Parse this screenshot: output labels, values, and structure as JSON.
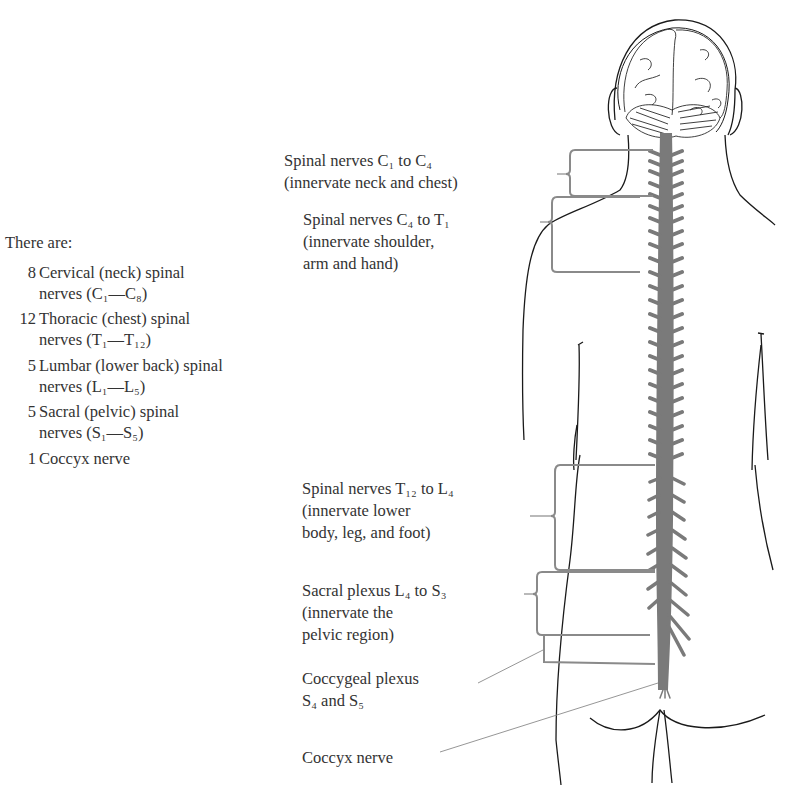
{
  "intro": {
    "heading": "There are:",
    "items": [
      {
        "count": "8",
        "line1": "Cervical (neck) spinal",
        "line2": "nerves (C₁—C₈)"
      },
      {
        "count": "12",
        "line1": "Thoracic (chest) spinal",
        "line2": "nerves (T₁—T₁₂)"
      },
      {
        "count": "5",
        "line1": "Lumbar (lower back) spinal",
        "line2": "nerves (L₁—L₅)"
      },
      {
        "count": "5",
        "line1": "Sacral (pelvic) spinal",
        "line2": "nerves (S₁—S₅)"
      },
      {
        "count": "1",
        "line1": "Coccyx nerve",
        "line2": ""
      }
    ]
  },
  "labels": {
    "c1_c4": {
      "line1": "Spinal nerves C₁ to C₄",
      "line2": "(innervate neck and chest)"
    },
    "c4_t1": {
      "line1": "Spinal nerves C₄ to T₁",
      "line2": "(innervate shoulder,",
      "line3": "arm and hand)"
    },
    "t12_l4": {
      "line1": "Spinal nerves T₁₂ to L₄",
      "line2": "(innervate lower",
      "line3": "body, leg, and foot)"
    },
    "sacral": {
      "line1": "Sacral plexus L₄ to S₃",
      "line2": "(innervate the",
      "line3": "pelvic region)"
    },
    "coccygeal": {
      "line1": "Coccygeal plexus",
      "line2": "S₄ and S₅"
    },
    "coccyx": {
      "line1": "Coccyx nerve"
    }
  },
  "colors": {
    "spine": "#7a7a7a",
    "bracket": "#8a8a8a",
    "outline": "#1a1a1a",
    "text": "#333333"
  }
}
